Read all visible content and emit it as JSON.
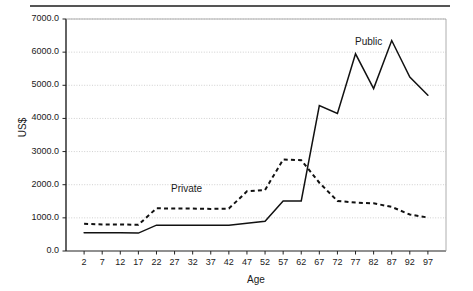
{
  "chart_data": {
    "type": "line",
    "title": "",
    "xlabel": "Age",
    "ylabel": "US$",
    "xlim": [
      0,
      99
    ],
    "ylim": [
      0,
      7000
    ],
    "grid": true,
    "legend_position": "inline-annotation",
    "categories": [
      2,
      7,
      12,
      17,
      22,
      27,
      32,
      37,
      42,
      47,
      52,
      57,
      62,
      67,
      72,
      77,
      82,
      87,
      92,
      97
    ],
    "x_tick_labels": [
      "2",
      "7",
      "12",
      "17",
      "22",
      "27",
      "32",
      "37",
      "42",
      "47",
      "52",
      "57",
      "62",
      "67",
      "72",
      "77",
      "82",
      "87",
      "92",
      "97"
    ],
    "y_tick_labels": [
      "0.0",
      "1000.0",
      "2000.0",
      "3000.0",
      "4000.0",
      "5000.0",
      "6000.0",
      "7000.0"
    ],
    "y_ticks": [
      0,
      1000,
      2000,
      3000,
      4000,
      5000,
      6000,
      7000
    ],
    "series": [
      {
        "name": "Public",
        "style": "solid",
        "color": "#111111",
        "label_text": "Public",
        "values": [
          550,
          550,
          550,
          540,
          780,
          780,
          780,
          780,
          780,
          840,
          900,
          1510,
          1510,
          4390,
          4150,
          5950,
          4900,
          6350,
          5250,
          4700
        ]
      },
      {
        "name": "Private",
        "style": "dashed",
        "color": "#111111",
        "label_text": "Private",
        "values": [
          820,
          800,
          800,
          790,
          1290,
          1280,
          1280,
          1270,
          1280,
          1800,
          1840,
          2760,
          2740,
          2060,
          1510,
          1460,
          1440,
          1330,
          1100,
          1010
        ]
      }
    ],
    "annotations": [
      {
        "text": "Private",
        "x_px": 171,
        "y_px": 183
      },
      {
        "text": "Public",
        "x_px": 355,
        "y_px": 36
      }
    ]
  },
  "figure": {
    "top_rule_color": "#555555",
    "plot_frame_color": "#222222",
    "gridline_color": "#bbbbbb",
    "background": "#ffffff"
  }
}
